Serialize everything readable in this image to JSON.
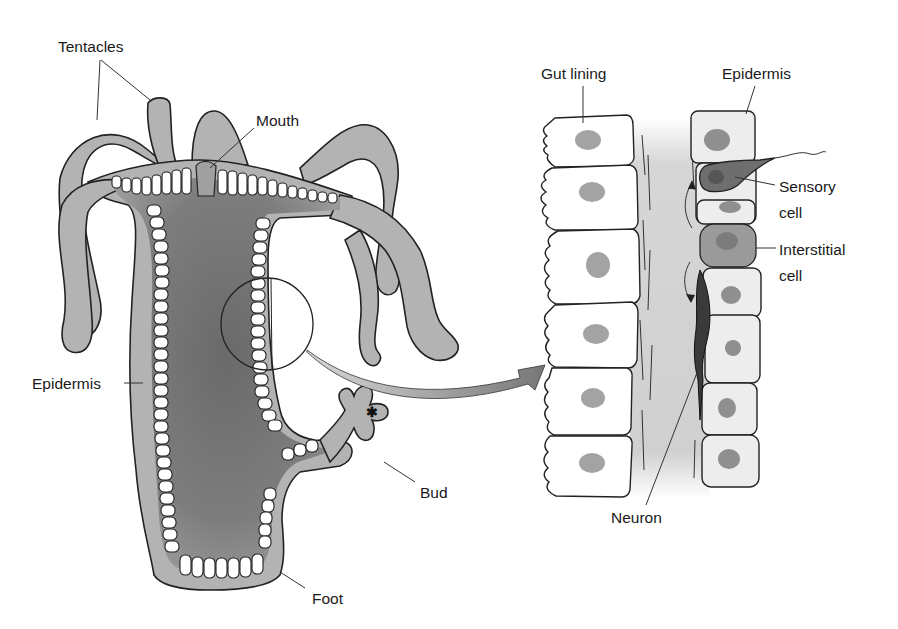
{
  "figure": {
    "colors": {
      "body_tissue": "#b3b3b3",
      "gastrovascular_cavity": "#7a7a7a",
      "cells": "#ffffff",
      "epidermis_cells": "#ededed",
      "nuclei": "#a3a3a3",
      "sensory_cell": "#6e6e6e",
      "interstitial_cell": "#9a9a9a",
      "mesoglea": "#d0d0d0",
      "outline": "#222222"
    }
  },
  "left_panel": {
    "labels": {
      "tentacles": "Tentacles",
      "mouth": "Mouth",
      "epidermis": "Epidermis",
      "bud": "Bud",
      "foot": "Foot"
    }
  },
  "right_panel": {
    "labels": {
      "gut_lining": "Gut lining",
      "epidermis": "Epidermis",
      "sensory_cell_line1": "Sensory",
      "sensory_cell_line2": "cell",
      "interstitial_cell_line1": "Interstitial",
      "interstitial_cell_line2": "cell",
      "neuron": "Neuron"
    },
    "gut_lining_cell_count": 6,
    "epidermis_cell_count": 8
  },
  "magnifier": {
    "description": "Circle on body wall with arrow pointing to magnified view"
  }
}
